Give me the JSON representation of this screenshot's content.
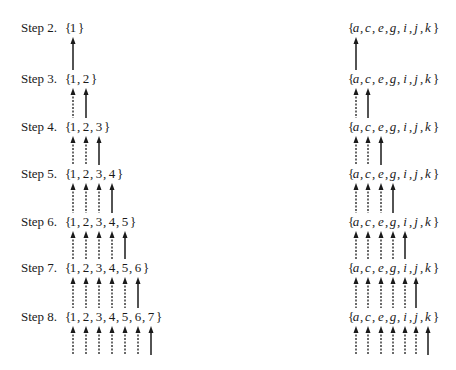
{
  "diagram": {
    "left": {
      "steps": [
        {
          "label": "Step 2.",
          "set": [
            "1"
          ]
        },
        {
          "label": "Step 3.",
          "set": [
            "1",
            "2"
          ]
        },
        {
          "label": "Step 4.",
          "set": [
            "1",
            "2",
            "3"
          ]
        },
        {
          "label": "Step 5.",
          "set": [
            "1",
            "2",
            "3",
            "4"
          ]
        },
        {
          "label": "Step 6.",
          "set": [
            "1",
            "2",
            "3",
            "4",
            "5"
          ]
        },
        {
          "label": "Step 7.",
          "set": [
            "1",
            "2",
            "3",
            "4",
            "5",
            "6"
          ]
        },
        {
          "label": "Step 8.",
          "set": [
            "1",
            "2",
            "3",
            "4",
            "5",
            "6",
            "7"
          ]
        }
      ]
    },
    "right": {
      "set": [
        "a",
        "c",
        "e",
        "g",
        "i",
        "j",
        "k"
      ],
      "rows": 7
    },
    "arrows": {
      "description": "Below each set, arrows point up into it; the last element's arrow is solid (new), earlier ones dashed (carried over).",
      "solid_style": "solid",
      "carried_style": "dashed",
      "color": "#1a1a1a"
    }
  }
}
